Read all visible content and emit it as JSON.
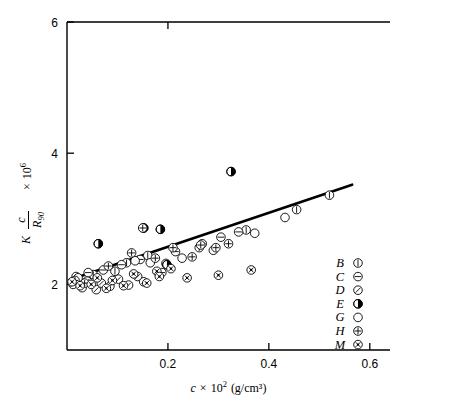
{
  "chart_data": {
    "type": "scatter",
    "title": "",
    "xlabel": "c × 10² (g/cm³)",
    "ylabel": "K c/R₉₀ × 10⁶",
    "ylabel_parts": {
      "k": "K",
      "num": "c",
      "den": "R",
      "den_sub": "90",
      "times": "×",
      "base": "10",
      "exp": "6"
    },
    "xlabel_parts": {
      "c": "c",
      "times": "×",
      "base": "10",
      "exp": "2",
      "units": "(g/cm³)"
    },
    "xlim": [
      0.0,
      0.64
    ],
    "ylim": [
      1.0,
      6.0
    ],
    "xticks": [
      0.2,
      0.4,
      0.6
    ],
    "xticklabels": [
      "0.2",
      "0.4",
      "0.6"
    ],
    "yticks": [
      2,
      4,
      6
    ],
    "yticklabels": [
      "2",
      "4",
      "6"
    ],
    "grid": false,
    "legend_position": "lower-right-inside",
    "frame": "top-left-bottom",
    "trendline": {
      "x": [
        0.025,
        0.565
      ],
      "y": [
        2.12,
        3.52
      ],
      "slope": 2.59,
      "intercept": 2.055
    },
    "legend": [
      {
        "name": "B",
        "marker": "circle-vertical-bar"
      },
      {
        "name": "C",
        "marker": "circle-horizontal-bar"
      },
      {
        "name": "D",
        "marker": "circle-diagonal-slash"
      },
      {
        "name": "E",
        "marker": "circle-half-filled"
      },
      {
        "name": "G",
        "marker": "circle-open"
      },
      {
        "name": "H",
        "marker": "circle-plus"
      },
      {
        "name": "M",
        "marker": "circle-crossed-dot"
      }
    ],
    "series": [
      {
        "name": "B",
        "marker": "circle-vertical-bar",
        "points": [
          [
            0.02,
            2.07
          ],
          [
            0.052,
            2.15
          ],
          [
            0.095,
            2.2
          ],
          [
            0.118,
            2.33
          ],
          [
            0.16,
            2.44
          ],
          [
            0.196,
            2.32
          ],
          [
            0.262,
            2.56
          ],
          [
            0.355,
            2.83
          ],
          [
            0.455,
            3.14
          ],
          [
            0.52,
            3.36
          ]
        ]
      },
      {
        "name": "C",
        "marker": "circle-horizontal-bar",
        "points": [
          [
            0.018,
            2.12
          ],
          [
            0.042,
            2.18
          ],
          [
            0.072,
            2.22
          ],
          [
            0.108,
            2.3
          ],
          [
            0.145,
            2.38
          ],
          [
            0.188,
            2.18
          ],
          [
            0.215,
            2.5
          ],
          [
            0.268,
            2.62
          ],
          [
            0.305,
            2.72
          ],
          [
            0.34,
            2.8
          ]
        ]
      },
      {
        "name": "D",
        "marker": "circle-diagonal-slash",
        "points": [
          [
            0.012,
            2.0
          ],
          [
            0.03,
            1.95
          ],
          [
            0.04,
            2.05
          ],
          [
            0.058,
            1.92
          ],
          [
            0.068,
            2.02
          ],
          [
            0.085,
            1.97
          ],
          [
            0.102,
            2.08
          ],
          [
            0.122,
            1.99
          ],
          [
            0.14,
            2.12
          ],
          [
            0.152,
            2.04
          ]
        ]
      },
      {
        "name": "E",
        "marker": "circle-half-filled",
        "points": [
          [
            0.062,
            2.62
          ],
          [
            0.152,
            2.86
          ],
          [
            0.185,
            2.84
          ],
          [
            0.325,
            3.72
          ],
          [
            0.198,
            2.3
          ]
        ]
      },
      {
        "name": "G",
        "marker": "circle-open",
        "points": [
          [
            0.022,
            2.1
          ],
          [
            0.135,
            2.36
          ],
          [
            0.165,
            2.33
          ],
          [
            0.228,
            2.4
          ],
          [
            0.29,
            2.52
          ],
          [
            0.372,
            2.78
          ],
          [
            0.432,
            3.02
          ]
        ]
      },
      {
        "name": "H",
        "marker": "circle-plus",
        "points": [
          [
            0.016,
            2.06
          ],
          [
            0.035,
            2.02
          ],
          [
            0.082,
            2.28
          ],
          [
            0.128,
            2.48
          ],
          [
            0.15,
            2.86
          ],
          [
            0.175,
            2.4
          ],
          [
            0.21,
            2.56
          ],
          [
            0.248,
            2.42
          ],
          [
            0.265,
            2.6
          ],
          [
            0.295,
            2.56
          ],
          [
            0.32,
            2.62
          ]
        ]
      },
      {
        "name": "M",
        "marker": "circle-crossed-dot",
        "points": [
          [
            0.01,
            2.04
          ],
          [
            0.026,
            1.98
          ],
          [
            0.048,
            2.0
          ],
          [
            0.06,
            2.1
          ],
          [
            0.078,
            1.94
          ],
          [
            0.09,
            2.06
          ],
          [
            0.112,
            1.98
          ],
          [
            0.132,
            2.16
          ],
          [
            0.158,
            2.02
          ],
          [
            0.178,
            2.2
          ],
          [
            0.183,
            2.12
          ],
          [
            0.206,
            2.24
          ],
          [
            0.238,
            2.1
          ],
          [
            0.3,
            2.14
          ],
          [
            0.365,
            2.22
          ]
        ]
      }
    ]
  }
}
